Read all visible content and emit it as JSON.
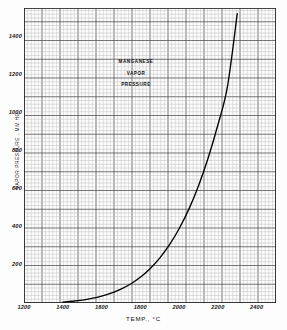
{
  "chart_data": {
    "type": "line",
    "title": "MANGANESE VAPOR PRESSURE",
    "title_lines": [
      "MANGANESE",
      "VAPOR",
      "PRESSURE"
    ],
    "xlabel": "TEMP., °C",
    "ylabel": "VAPOR PRESSURE , MM HG",
    "xlim": [
      1200,
      2500
    ],
    "ylim": [
      0,
      1550
    ],
    "xticks": [
      1200,
      1400,
      1600,
      1800,
      2000,
      2200,
      2400
    ],
    "xtick_labels": [
      "1200",
      "1400",
      "1600",
      "1800",
      "2000",
      "2200",
      "2400"
    ],
    "yticks": [
      200,
      400,
      600,
      800,
      1000,
      1200,
      1400
    ],
    "ytick_labels": [
      "200",
      "400",
      "600",
      "800",
      "1000",
      "1200",
      "1400"
    ],
    "grid": true,
    "grid_minor": true,
    "grid_major_every": 5,
    "legend": null,
    "series": [
      {
        "name": "Manganese vapor pressure",
        "color": "#000000",
        "x": [
          1400,
          1450,
          1500,
          1550,
          1600,
          1650,
          1700,
          1750,
          1800,
          1850,
          1900,
          1950,
          2000,
          2050,
          2100,
          2150,
          2200,
          2250,
          2300
        ],
        "y": [
          5,
          9,
          15,
          24,
          36,
          52,
          73,
          100,
          135,
          180,
          236,
          305,
          390,
          492,
          615,
          762,
          935,
          1140,
          1520
        ]
      }
    ]
  },
  "axes": {
    "x_axis_title": "TEMP., °C",
    "y_axis_title": "VAPOR PRESSURE , MM HG"
  },
  "colors": {
    "curve": "#000000",
    "grid_minor": "#b9b9b9",
    "grid_major": "#4a4a4a",
    "frame": "#1a1a1a",
    "background": "#fdfdfd",
    "text": "#111111"
  }
}
